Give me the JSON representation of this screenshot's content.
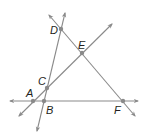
{
  "diagram": {
    "type": "geometry-lines",
    "line_color": "#8a8a8a",
    "point_color": "#8a8a8a",
    "label_color": "#231f20",
    "points": [
      {
        "name": "A",
        "x": 33,
        "y": 101,
        "label_x": 26,
        "label_y": 97
      },
      {
        "name": "B",
        "x": 44,
        "y": 101,
        "label_x": 46,
        "label_y": 114
      },
      {
        "name": "C",
        "x": 47,
        "y": 88,
        "label_x": 38,
        "label_y": 85
      },
      {
        "name": "D",
        "x": 61,
        "y": 29,
        "label_x": 50,
        "label_y": 34
      },
      {
        "name": "E",
        "x": 82,
        "y": 53,
        "label_x": 78,
        "label_y": 49
      },
      {
        "name": "F",
        "x": 123,
        "y": 101,
        "label_x": 114,
        "label_y": 114
      }
    ],
    "lines": [
      {
        "name": "line-AF",
        "through": [
          "A",
          "B",
          "F"
        ],
        "x1": 10,
        "y1": 101,
        "x2": 138,
        "y2": 101
      },
      {
        "name": "line-BD",
        "through": [
          "B",
          "C",
          "D"
        ],
        "x1": 37,
        "y1": 131,
        "x2": 65,
        "y2": 13
      },
      {
        "name": "line-AE",
        "through": [
          "A",
          "C",
          "E"
        ],
        "x1": 19,
        "y1": 116,
        "x2": 112,
        "y2": 24
      },
      {
        "name": "line-DF",
        "through": [
          "D",
          "E",
          "F"
        ],
        "x1": 49,
        "y1": 15,
        "x2": 135,
        "y2": 116
      }
    ]
  }
}
